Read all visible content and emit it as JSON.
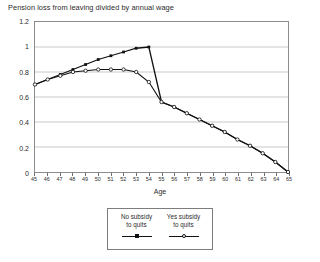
{
  "chart_data": {
    "type": "line",
    "title": "Pension loss from leaving divided by annual wage",
    "xlabel": "Age",
    "ylabel": "",
    "xlim": [
      45,
      65
    ],
    "ylim": [
      0,
      1.2
    ],
    "ytick_labels": [
      "0",
      "0.2",
      "0.4",
      "0.6",
      "0.8",
      "1",
      "1.2"
    ],
    "ytick_values": [
      0,
      0.2,
      0.4,
      0.6,
      0.8,
      1,
      1.2
    ],
    "grid": "horizontal",
    "legend_position": "bottom-center",
    "x": [
      45,
      46,
      47,
      48,
      49,
      50,
      51,
      52,
      53,
      54,
      55,
      56,
      57,
      58,
      59,
      60,
      61,
      62,
      63,
      64,
      65
    ],
    "categories": [
      "45",
      "46",
      "47",
      "48",
      "49",
      "50",
      "51",
      "52",
      "53",
      "54",
      "55",
      "56",
      "57",
      "58",
      "59",
      "60",
      "61",
      "62",
      "63",
      "64",
      "65"
    ],
    "series": [
      {
        "name": "No subsidy to quits",
        "marker": "filled-square",
        "values": [
          0.7,
          0.74,
          0.78,
          0.82,
          0.86,
          0.9,
          0.93,
          0.96,
          0.99,
          1.0,
          0.56,
          0.52,
          0.47,
          0.42,
          0.37,
          0.32,
          0.26,
          0.21,
          0.15,
          0.08,
          0.0
        ]
      },
      {
        "name": "Yes subsidy to quits",
        "marker": "open-circle",
        "values": [
          0.7,
          0.74,
          0.77,
          0.8,
          0.81,
          0.82,
          0.82,
          0.82,
          0.8,
          0.72,
          0.56,
          0.52,
          0.47,
          0.42,
          0.37,
          0.32,
          0.26,
          0.21,
          0.15,
          0.08,
          0.0
        ]
      }
    ]
  },
  "legend": {
    "entries": [
      {
        "line1": "No subsidy",
        "line2": "to quits"
      },
      {
        "line1": "Yes subsidy",
        "line2": "to quits"
      }
    ]
  },
  "colors": {
    "series_line": "#111111",
    "grid": "#c9c9c9",
    "frame": "#8c8c8c",
    "text": "#2b2b2b",
    "background": "#ffffff"
  }
}
